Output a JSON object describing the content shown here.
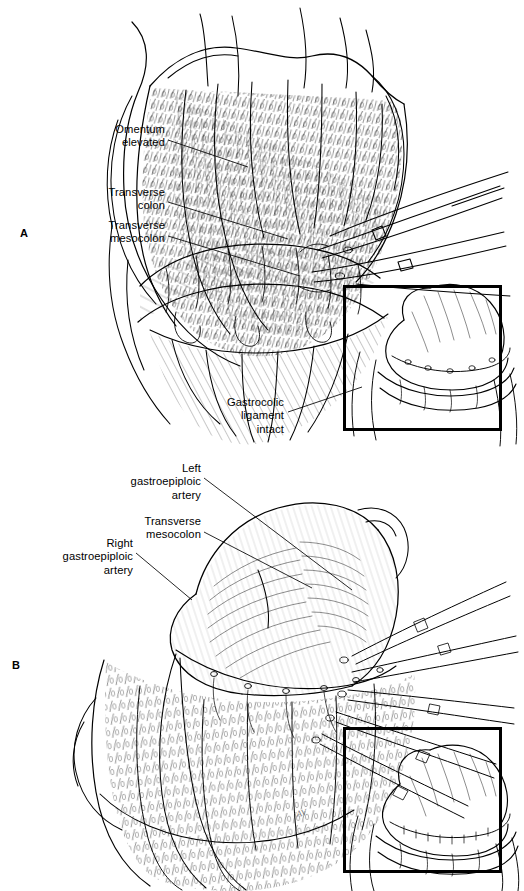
{
  "figure": {
    "background": "#ffffff",
    "ink": "#000000",
    "width": 524,
    "height": 891,
    "type": "medical-surgical-line-illustration"
  },
  "panels": [
    {
      "id": "a",
      "letter": "A",
      "letter_x": 20,
      "letter_y": 228,
      "description": "Greater omentum elevated off the transverse colon; long curved surgical clamps enter from the right; gastrocolic ligament still intact.",
      "labels": [
        {
          "id": "omentum-elevated",
          "text": "Omentum\nelevated",
          "x": 60,
          "y": 123,
          "w": 105,
          "leader": {
            "x1": 168,
            "y1": 140,
            "x2": 248,
            "y2": 167
          }
        },
        {
          "id": "transverse-colon",
          "text": "Transverse\ncolon",
          "x": 52,
          "y": 186,
          "w": 113,
          "leader": {
            "x1": 168,
            "y1": 202,
            "x2": 288,
            "y2": 239
          }
        },
        {
          "id": "transverse-mesocolon",
          "text": "Transverse\nmesocolon",
          "x": 44,
          "y": 219,
          "w": 121,
          "leader": {
            "x1": 168,
            "y1": 236,
            "x2": 300,
            "y2": 276
          }
        },
        {
          "id": "gastrocolic-ligament-intact",
          "text": "Gastrocolic\nligament\nintact",
          "x": 188,
          "y": 396,
          "w": 96,
          "leader": {
            "x1": 288,
            "y1": 412,
            "x2": 360,
            "y2": 388
          }
        }
      ],
      "inset": {
        "x": 343,
        "y": 285,
        "w": 153,
        "h": 140
      }
    },
    {
      "id": "b",
      "letter": "B",
      "letter_x": 12,
      "letter_y": 660,
      "description": "Gastrocolic ligament divided; stomach retracted upward with fan of hemostats along the greater curvature exposing the gastroepiploic arcade.",
      "labels": [
        {
          "id": "left-gastroepiploic-artery",
          "text": "Left\ngastroepiploic\nartery",
          "x": 88,
          "y": 462,
          "w": 113,
          "leader": {
            "x1": 204,
            "y1": 478,
            "x2": 352,
            "y2": 590
          }
        },
        {
          "id": "transverse-mesocolon",
          "text": "Transverse\nmesocolon",
          "x": 95,
          "y": 515,
          "w": 106,
          "leader": {
            "x1": 204,
            "y1": 532,
            "x2": 312,
            "y2": 588
          }
        },
        {
          "id": "right-gastroepiploic-artery",
          "text": "Right\ngastroepiploic\nartery",
          "x": 20,
          "y": 537,
          "w": 113,
          "leader": {
            "x1": 136,
            "y1": 553,
            "x2": 190,
            "y2": 597
          }
        }
      ],
      "inset": {
        "x": 343,
        "y": 727,
        "w": 153,
        "h": 140
      },
      "signature": {
        "text": "AV",
        "x": 296,
        "y": 808
      }
    }
  ]
}
